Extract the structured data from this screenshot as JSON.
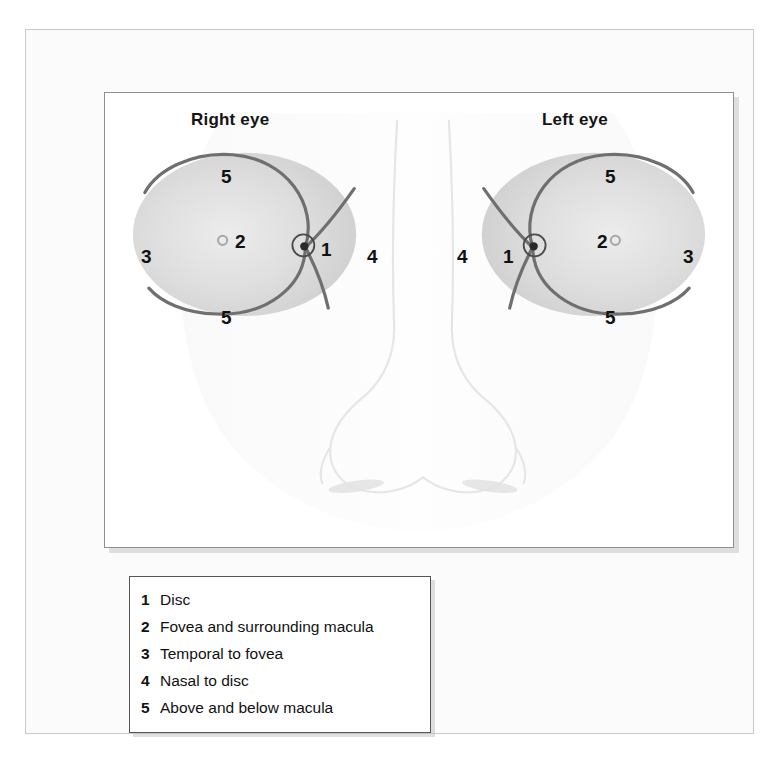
{
  "figure": {
    "panel": {
      "eyes": [
        {
          "id": "right-eye",
          "title": "Right eye",
          "side": "right",
          "markers": [
            {
              "key": "5",
              "region": "above-macula",
              "x": 88,
              "y": 46
            },
            {
              "key": "3",
              "region": "temporal",
              "x": 8,
              "y": 126
            },
            {
              "key": "2",
              "region": "fovea",
              "x": 95,
              "y": 137
            },
            {
              "key": "1",
              "region": "disc",
              "x": 180,
              "y": 142
            },
            {
              "key": "4",
              "region": "nasal",
              "x": 238,
              "y": 126
            },
            {
              "key": "5",
              "region": "below-macula",
              "x": 88,
              "y": 196
            }
          ]
        },
        {
          "id": "left-eye",
          "title": "Left eye",
          "side": "left",
          "markers": [
            {
              "key": "5",
              "region": "above-macula",
              "x": 160,
              "y": 46
            },
            {
              "key": "4",
              "region": "nasal",
              "x": 8,
              "y": 126
            },
            {
              "key": "1",
              "region": "disc",
              "x": 62,
              "y": 142
            },
            {
              "key": "2",
              "region": "fovea",
              "x": 152,
              "y": 137
            },
            {
              "key": "3",
              "region": "temporal",
              "x": 238,
              "y": 126
            },
            {
              "key": "5",
              "region": "below-macula",
              "x": 160,
              "y": 196
            }
          ]
        }
      ]
    },
    "legend": {
      "items": [
        {
          "key": "1",
          "label": "Disc"
        },
        {
          "key": "2",
          "label": "Fovea and surrounding macula"
        },
        {
          "key": "3",
          "label": "Temporal to fovea"
        },
        {
          "key": "4",
          "label": "Nasal to disc"
        },
        {
          "key": "5",
          "label": "Above and below macula"
        }
      ]
    },
    "colors": {
      "fundus_fill": "#d2d2d2",
      "fundus_center": "#e8e8e8",
      "vessel": "#6f6f6f",
      "disc_outline": "#4a4a4a",
      "label_text": "#111111",
      "frame_border": "#c9c9c9",
      "panel_border": "#8f8f8f",
      "legend_border": "#555555",
      "face_line": "#ededed",
      "background": "#ffffff"
    }
  }
}
